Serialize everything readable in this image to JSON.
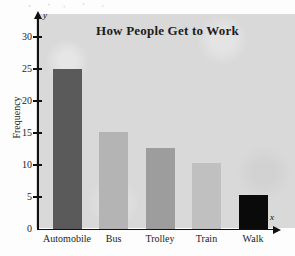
{
  "chart_data": {
    "type": "bar",
    "title": "How People Get to Work",
    "xlabel": "",
    "ylabel": "Frequency",
    "categories": [
      "Automobile",
      "Bus",
      "Trolley",
      "Train",
      "Walk"
    ],
    "values": [
      25,
      15.2,
      12.7,
      10.3,
      5.3
    ],
    "bar_colors": [
      "#5a5a5a",
      "#b4b4b4",
      "#9d9d9d",
      "#c0c0c0",
      "#0a0a0a"
    ],
    "ylim": [
      0,
      33
    ],
    "yticks": [
      0,
      5,
      10,
      15,
      20,
      25,
      30
    ],
    "ytick_labels": [
      "0",
      "5",
      "10",
      "15",
      "20",
      "25",
      "30"
    ],
    "grid": false,
    "legend": "none",
    "axis_variable_x": "x",
    "axis_variable_y": "y",
    "plot_background": "#d9d9d9"
  }
}
